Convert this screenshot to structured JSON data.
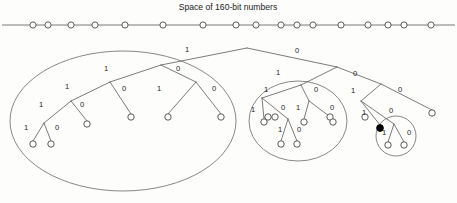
{
  "title": "Space of 160-bit numbers",
  "axis": {
    "name": "number-space-axis",
    "y": 25,
    "x_start": 2,
    "x_end": 455,
    "nodes": [
      {
        "x": 33
      },
      {
        "x": 48
      },
      {
        "x": 71
      },
      {
        "x": 95
      },
      {
        "x": 125
      },
      {
        "x": 163
      },
      {
        "x": 203
      },
      {
        "x": 236
      },
      {
        "x": 256
      },
      {
        "x": 281
      },
      {
        "x": 297
      },
      {
        "x": 313
      },
      {
        "x": 341
      },
      {
        "x": 368
      },
      {
        "x": 388
      },
      {
        "x": 404
      },
      {
        "x": 431
      }
    ],
    "node_radius": 3.1
  },
  "tree": {
    "nodes": [
      {
        "id": "root",
        "x": 247,
        "y": 48,
        "r": 0,
        "filled": false,
        "draw": false
      },
      {
        "id": "n-1",
        "x": 161,
        "y": 65,
        "r": 0,
        "filled": false,
        "draw": false
      },
      {
        "id": "n-0",
        "x": 337,
        "y": 67,
        "r": 0,
        "filled": false,
        "draw": false
      },
      {
        "id": "n-11",
        "x": 110,
        "y": 82,
        "r": 0,
        "filled": false,
        "draw": false
      },
      {
        "id": "n-10",
        "x": 196,
        "y": 82,
        "r": 0,
        "filled": false,
        "draw": false
      },
      {
        "id": "n-01",
        "x": 301,
        "y": 85,
        "r": 0,
        "filled": false,
        "draw": false
      },
      {
        "id": "n-00",
        "x": 381,
        "y": 84,
        "r": 0,
        "filled": false,
        "draw": false
      },
      {
        "id": "n-111",
        "x": 71,
        "y": 101,
        "r": 0,
        "filled": false,
        "draw": false
      },
      {
        "id": "n-110-leaf",
        "x": 131,
        "y": 117,
        "r": 3.2,
        "filled": false,
        "draw": true
      },
      {
        "id": "n-101-leaf",
        "x": 168,
        "y": 117,
        "r": 3.2,
        "filled": false,
        "draw": true
      },
      {
        "id": "n-100-leaf",
        "x": 221,
        "y": 117,
        "r": 3.2,
        "filled": false,
        "draw": true
      },
      {
        "id": "n-011-leaf",
        "x": 268,
        "y": 117,
        "r": 3.2,
        "filled": false,
        "draw": true
      },
      {
        "id": "n-010",
        "x": 321,
        "y": 103,
        "r": 0,
        "filled": false,
        "draw": false
      },
      {
        "id": "n-001",
        "x": 361,
        "y": 101,
        "r": 0,
        "filled": false,
        "draw": false
      },
      {
        "id": "n-000-leaf",
        "x": 432,
        "y": 113,
        "r": 3.2,
        "filled": false,
        "draw": true
      },
      {
        "id": "n-1111",
        "x": 44,
        "y": 123,
        "r": 0,
        "filled": false,
        "draw": false
      },
      {
        "id": "n-1110-leaf",
        "x": 87,
        "y": 124,
        "r": 3.2,
        "filled": false,
        "draw": true
      },
      {
        "id": "n-11111-leaf",
        "x": 33,
        "y": 144,
        "r": 3.2,
        "filled": false,
        "draw": true
      },
      {
        "id": "n-11110-leaf",
        "x": 51,
        "y": 144,
        "r": 3.2,
        "filled": false,
        "draw": true
      },
      {
        "id": "n-0111-leaf",
        "x": 275,
        "y": 117,
        "r": 3.2,
        "filled": false,
        "draw": true
      },
      {
        "id": "n-0110-leaf",
        "x": 330,
        "y": 117,
        "r": 3.2,
        "filled": false,
        "draw": true
      },
      {
        "id": "n-0101-leaf",
        "x": 365,
        "y": 117,
        "r": 3.2,
        "filled": false,
        "draw": true
      },
      {
        "id": "n-0100-dot",
        "x": 380,
        "y": 128,
        "r": 3.4,
        "filled": true,
        "draw": true
      },
      {
        "id": "n-target-left",
        "x": 388,
        "y": 145,
        "r": 3.2,
        "filled": false,
        "draw": true
      },
      {
        "id": "n-target-right",
        "x": 404,
        "y": 145,
        "r": 3.2,
        "filled": false,
        "draw": true
      },
      {
        "id": "n-mid-l",
        "x": 262,
        "y": 98,
        "r": 0,
        "filled": false,
        "draw": false
      },
      {
        "id": "n-mid-r",
        "x": 309,
        "y": 101,
        "r": 0,
        "filled": false,
        "draw": false
      },
      {
        "id": "n-mid-ll-leaf",
        "x": 264,
        "y": 122,
        "r": 3.2,
        "filled": false,
        "draw": true
      },
      {
        "id": "n-mid-lr",
        "x": 288,
        "y": 122,
        "r": 0,
        "filled": false,
        "draw": false
      },
      {
        "id": "n-mid-lr-l",
        "x": 281,
        "y": 144,
        "r": 3.2,
        "filled": false,
        "draw": true
      },
      {
        "id": "n-mid-lr-r",
        "x": 297,
        "y": 144,
        "r": 3.2,
        "filled": false,
        "draw": true
      },
      {
        "id": "n-mid-rl-leaf",
        "x": 304,
        "y": 122,
        "r": 3.2,
        "filled": false,
        "draw": true
      },
      {
        "id": "n-mid-rr-leaf",
        "x": 333,
        "y": 122,
        "r": 3.2,
        "filled": false,
        "draw": true
      },
      {
        "id": "n-sm-apex",
        "x": 394,
        "y": 124,
        "r": 0,
        "filled": false,
        "draw": false
      }
    ],
    "edges": [
      {
        "from": [
          247,
          48
        ],
        "to": [
          161,
          65
        ]
      },
      {
        "from": [
          247,
          48
        ],
        "to": [
          337,
          67
        ]
      },
      {
        "from": [
          161,
          65
        ],
        "to": [
          110,
          82
        ]
      },
      {
        "from": [
          161,
          65
        ],
        "to": [
          196,
          82
        ]
      },
      {
        "from": [
          110,
          82
        ],
        "to": [
          71,
          101
        ]
      },
      {
        "from": [
          110,
          82
        ],
        "to": [
          131,
          114
        ]
      },
      {
        "from": [
          196,
          82
        ],
        "to": [
          168,
          114
        ]
      },
      {
        "from": [
          196,
          82
        ],
        "to": [
          221,
          114
        ]
      },
      {
        "from": [
          71,
          101
        ],
        "to": [
          44,
          123
        ]
      },
      {
        "from": [
          71,
          101
        ],
        "to": [
          87,
          121
        ]
      },
      {
        "from": [
          44,
          123
        ],
        "to": [
          33,
          141
        ]
      },
      {
        "from": [
          44,
          123
        ],
        "to": [
          51,
          141
        ]
      },
      {
        "from": [
          337,
          67
        ],
        "to": [
          301,
          85
        ]
      },
      {
        "from": [
          337,
          67
        ],
        "to": [
          381,
          84
        ]
      },
      {
        "from": [
          301,
          85
        ],
        "to": [
          262,
          98
        ]
      },
      {
        "from": [
          301,
          85
        ],
        "to": [
          309,
          101
        ]
      },
      {
        "from": [
          262,
          98
        ],
        "to": [
          264,
          119
        ]
      },
      {
        "from": [
          262,
          98
        ],
        "to": [
          288,
          119
        ]
      },
      {
        "from": [
          288,
          119
        ],
        "to": [
          281,
          141
        ]
      },
      {
        "from": [
          288,
          119
        ],
        "to": [
          297,
          141
        ]
      },
      {
        "from": [
          309,
          101
        ],
        "to": [
          304,
          119
        ]
      },
      {
        "from": [
          309,
          101
        ],
        "to": [
          333,
          119
        ]
      },
      {
        "from": [
          381,
          84
        ],
        "to": [
          361,
          101
        ]
      },
      {
        "from": [
          381,
          84
        ],
        "to": [
          432,
          110
        ]
      },
      {
        "from": [
          361,
          101
        ],
        "to": [
          380,
          125
        ]
      },
      {
        "from": [
          361,
          101
        ],
        "to": [
          394,
          124
        ]
      },
      {
        "from": [
          394,
          124
        ],
        "to": [
          388,
          142
        ]
      },
      {
        "from": [
          394,
          124
        ],
        "to": [
          404,
          142
        ]
      }
    ],
    "bit_labels": [
      {
        "text": "1",
        "x": 187,
        "y": 50
      },
      {
        "text": "0",
        "x": 297,
        "y": 51
      },
      {
        "text": "1",
        "x": 106,
        "y": 69
      },
      {
        "text": "0",
        "x": 178,
        "y": 69
      },
      {
        "text": "1",
        "x": 67,
        "y": 87
      },
      {
        "text": "0",
        "x": 124,
        "y": 89
      },
      {
        "text": "1",
        "x": 159,
        "y": 89
      },
      {
        "text": "0",
        "x": 214,
        "y": 89
      },
      {
        "text": "1",
        "x": 41,
        "y": 105
      },
      {
        "text": "0",
        "x": 82,
        "y": 105
      },
      {
        "text": "1",
        "x": 26,
        "y": 128
      },
      {
        "text": "0",
        "x": 57,
        "y": 128
      },
      {
        "text": "1",
        "x": 278,
        "y": 73
      },
      {
        "text": "0",
        "x": 355,
        "y": 74
      },
      {
        "text": "1",
        "x": 266,
        "y": 90
      },
      {
        "text": "0",
        "x": 316,
        "y": 90
      },
      {
        "text": "1",
        "x": 253,
        "y": 110
      },
      {
        "text": "0",
        "x": 283,
        "y": 108
      },
      {
        "text": "1",
        "x": 298,
        "y": 108
      },
      {
        "text": "0",
        "x": 332,
        "y": 108
      },
      {
        "text": "1",
        "x": 280,
        "y": 130
      },
      {
        "text": "0",
        "x": 299,
        "y": 130
      },
      {
        "text": "1",
        "x": 353,
        "y": 91
      },
      {
        "text": "0",
        "x": 400,
        "y": 90
      },
      {
        "text": "1",
        "x": 364,
        "y": 113
      },
      {
        "text": "0",
        "x": 391,
        "y": 111
      },
      {
        "text": "1",
        "x": 384,
        "y": 133
      },
      {
        "text": "0",
        "x": 409,
        "y": 133
      }
    ],
    "groups": [
      {
        "name": "group-left-large",
        "cx": 123,
        "cy": 121,
        "rx": 113,
        "ry": 70
      },
      {
        "name": "group-middle",
        "cx": 298,
        "cy": 121,
        "rx": 49,
        "ry": 40
      },
      {
        "name": "group-target-pair",
        "cx": 396,
        "cy": 136,
        "rx": 20,
        "ry": 20
      }
    ]
  }
}
